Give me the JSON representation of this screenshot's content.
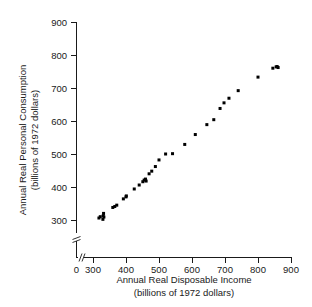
{
  "chart_data": {
    "type": "scatter",
    "title": "",
    "xlabel": "Annual Real Disposable Income",
    "xlabel_sub": "(billions of 1972 dollars)",
    "ylabel": "Annual Real Personal Consumption",
    "ylabel_sub": "(billions of 1972 dollars)",
    "xlim": [
      0,
      900
    ],
    "ylim": [
      250,
      900
    ],
    "x_axis_break": true,
    "y_axis_break": true,
    "x_break_between": [
      0,
      300
    ],
    "y_break_between": [
      250,
      300
    ],
    "grid": false,
    "legend": null,
    "xticks": [
      0,
      300,
      400,
      500,
      600,
      700,
      800,
      900
    ],
    "xtick_labels": [
      "0",
      "300",
      "400",
      "500",
      "600",
      "700",
      "800",
      "900"
    ],
    "yticks": [
      300,
      400,
      500,
      600,
      700,
      800,
      900
    ],
    "ytick_labels": [
      "300",
      "400",
      "500",
      "600",
      "700",
      "800",
      "900"
    ],
    "marker": "square",
    "marker_color": "#000000",
    "marker_size": 3,
    "points": [
      {
        "x": 318,
        "y": 306
      },
      {
        "x": 322,
        "y": 310
      },
      {
        "x": 330,
        "y": 302
      },
      {
        "x": 331,
        "y": 313
      },
      {
        "x": 332,
        "y": 320
      },
      {
        "x": 333,
        "y": 309
      },
      {
        "x": 360,
        "y": 338
      },
      {
        "x": 366,
        "y": 341
      },
      {
        "x": 372,
        "y": 345
      },
      {
        "x": 392,
        "y": 364
      },
      {
        "x": 400,
        "y": 370
      },
      {
        "x": 401,
        "y": 373
      },
      {
        "x": 425,
        "y": 394
      },
      {
        "x": 440,
        "y": 406
      },
      {
        "x": 451,
        "y": 416
      },
      {
        "x": 455,
        "y": 421
      },
      {
        "x": 459,
        "y": 424
      },
      {
        "x": 461,
        "y": 418
      },
      {
        "x": 470,
        "y": 440
      },
      {
        "x": 478,
        "y": 448
      },
      {
        "x": 489,
        "y": 462
      },
      {
        "x": 500,
        "y": 482
      },
      {
        "x": 520,
        "y": 500
      },
      {
        "x": 541,
        "y": 501
      },
      {
        "x": 578,
        "y": 529
      },
      {
        "x": 610,
        "y": 559
      },
      {
        "x": 645,
        "y": 589
      },
      {
        "x": 666,
        "y": 604
      },
      {
        "x": 685,
        "y": 638
      },
      {
        "x": 697,
        "y": 655
      },
      {
        "x": 712,
        "y": 669
      },
      {
        "x": 740,
        "y": 692
      },
      {
        "x": 800,
        "y": 733
      },
      {
        "x": 845,
        "y": 760
      },
      {
        "x": 855,
        "y": 764
      },
      {
        "x": 858,
        "y": 765
      },
      {
        "x": 861,
        "y": 762
      }
    ]
  }
}
